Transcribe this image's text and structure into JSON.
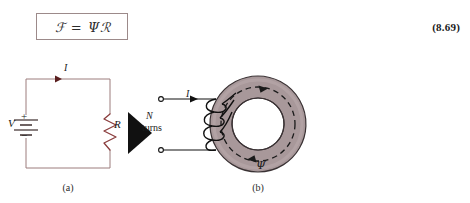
{
  "equation": {
    "box_text": "ℱ  =  Ψℛ",
    "number": "(8.69)",
    "border_color": "#9c8a8a"
  },
  "figure_a": {
    "caption": "(a)",
    "current_label": "I",
    "source_label": "V",
    "plus_sign": "+",
    "minus_sign": "−",
    "resistor_label": "R",
    "wire_color": "#9c7d7d",
    "arrow_color": "#5a1f1f"
  },
  "figure_b": {
    "caption": "(b)",
    "current_label": "I",
    "turns_count_label": "N",
    "turns_word": "turns",
    "flux_label": "Ψ",
    "core_fill": "#a8989a",
    "core_stroke": "#3a3234",
    "lead_color": "#111111",
    "winding_color": "#111111"
  },
  "arrow_marker": {
    "name": "implies-triangle",
    "color": "#111111"
  }
}
